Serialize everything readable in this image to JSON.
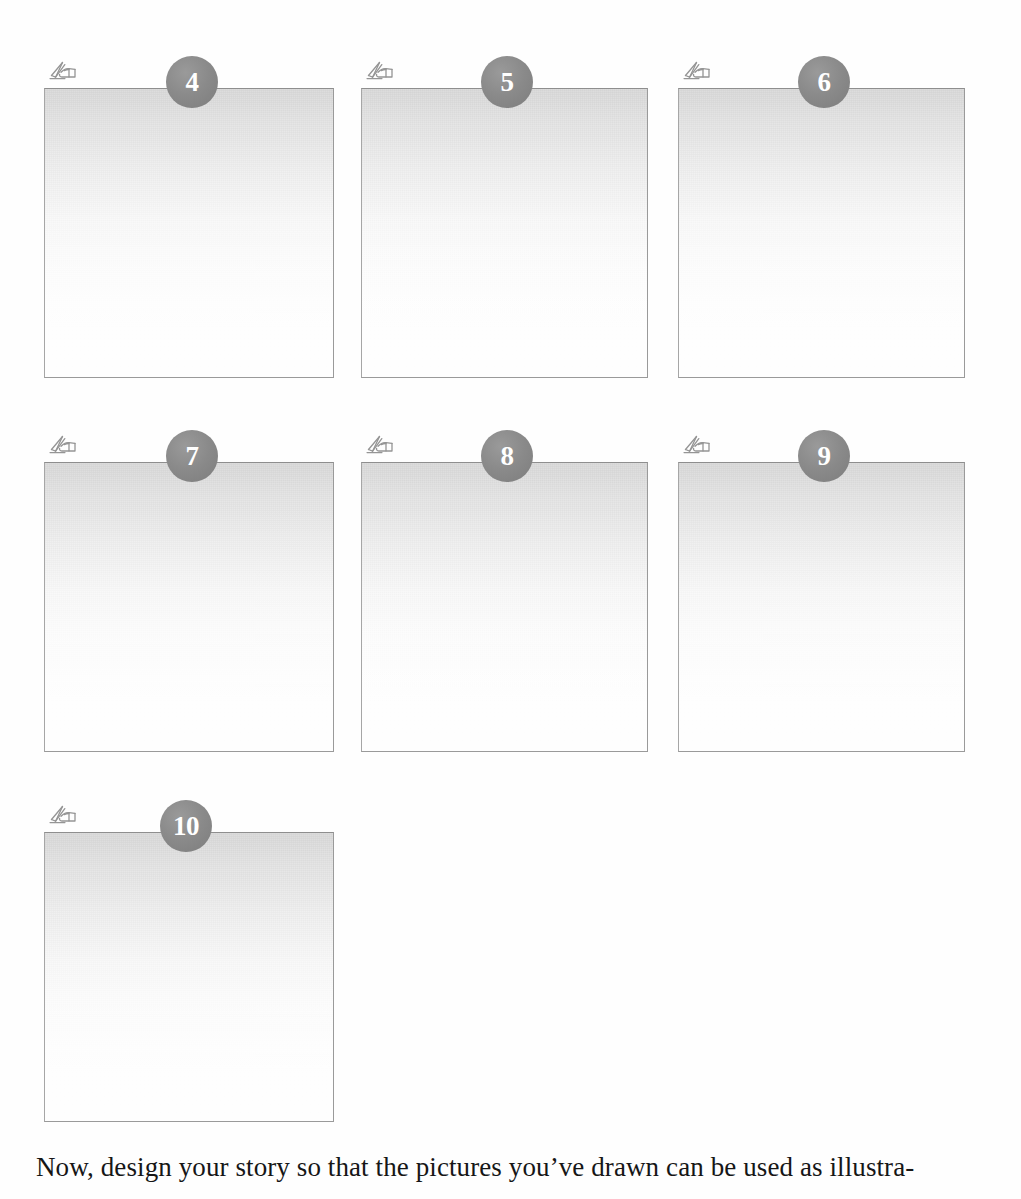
{
  "page": {
    "background_color": "#fefefe",
    "badge_color": "#888888",
    "badge_text_color": "#ffffff",
    "box_border_color": "#9a9a9a"
  },
  "panels": [
    {
      "number": "4",
      "icon": "hand-drawing-pencil-icon",
      "left": 44,
      "top": 56,
      "width": 290,
      "height": 322,
      "badge_left": 166
    },
    {
      "number": "5",
      "icon": "hand-drawing-pencil-icon",
      "left": 361,
      "top": 56,
      "width": 287,
      "height": 322,
      "badge_left": 481
    },
    {
      "number": "6",
      "icon": "hand-drawing-pencil-icon",
      "left": 678,
      "top": 56,
      "width": 287,
      "height": 322,
      "badge_left": 798
    },
    {
      "number": "7",
      "icon": "hand-drawing-pencil-icon",
      "left": 44,
      "top": 430,
      "width": 290,
      "height": 322,
      "badge_left": 166
    },
    {
      "number": "8",
      "icon": "hand-drawing-pencil-icon",
      "left": 361,
      "top": 430,
      "width": 287,
      "height": 322,
      "badge_left": 481
    },
    {
      "number": "9",
      "icon": "hand-drawing-pencil-icon",
      "left": 678,
      "top": 430,
      "width": 287,
      "height": 322,
      "badge_left": 798
    },
    {
      "number": "10",
      "icon": "hand-drawing-pencil-icon",
      "left": 44,
      "top": 800,
      "width": 290,
      "height": 322,
      "badge_left": 160
    }
  ],
  "caption": {
    "text": "Now, design your story so that the pictures you’ve drawn can be used as illustra-"
  }
}
